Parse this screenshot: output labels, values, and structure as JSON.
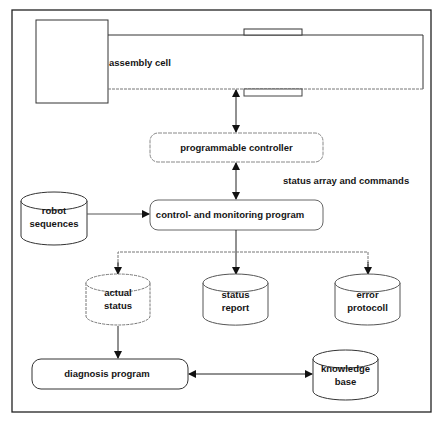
{
  "diagram": {
    "nodes": {
      "assembly_cell": {
        "label": "assembly cell"
      },
      "programmable_controller": {
        "label": "programmable controller"
      },
      "control_program": {
        "label": "control- and monitoring program"
      },
      "robot_sequences": {
        "line1": "robot",
        "line2": "sequences"
      },
      "actual_status": {
        "line1": "actual",
        "line2": "status"
      },
      "status_report": {
        "line1": "status",
        "line2": "report"
      },
      "error_protocoll": {
        "line1": "error",
        "line2": "protocoll"
      },
      "diagnosis_program": {
        "label": "diagnosis program"
      },
      "knowledge_base": {
        "line1": "knowledge",
        "line2": "base"
      }
    },
    "edge_labels": {
      "status_array": "status array and commands"
    },
    "edges": [
      {
        "from": "assembly_cell",
        "to": "programmable_controller",
        "type": "bidirectional"
      },
      {
        "from": "programmable_controller",
        "to": "control_program",
        "type": "bidirectional"
      },
      {
        "from": "robot_sequences",
        "to": "control_program",
        "type": "directed"
      },
      {
        "from": "control_program",
        "to": "actual_status",
        "type": "directed"
      },
      {
        "from": "control_program",
        "to": "status_report",
        "type": "directed"
      },
      {
        "from": "control_program",
        "to": "error_protocoll",
        "type": "directed"
      },
      {
        "from": "actual_status",
        "to": "diagnosis_program",
        "type": "directed"
      },
      {
        "from": "diagnosis_program",
        "to": "knowledge_base",
        "type": "bidirectional"
      }
    ],
    "colors": {
      "stroke": "#222222",
      "background": "#ffffff"
    }
  }
}
